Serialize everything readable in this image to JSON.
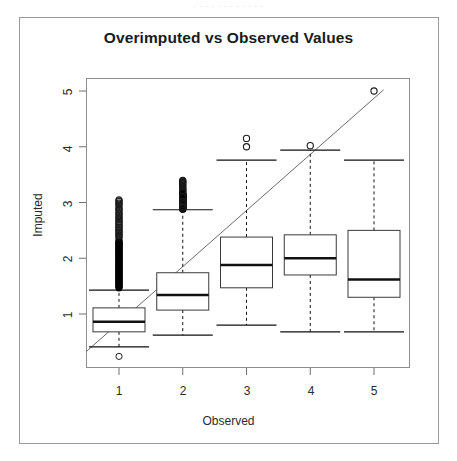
{
  "scan": {
    "top_partial_text": "· ·  ·   ·    ·  ·   ·    ·   ·  ·    ·  ·"
  },
  "figure": {
    "title": "Overimputed vs Observed Values",
    "xlabel": "Observed",
    "ylabel": "Imputed",
    "background": "#ffffff",
    "frame_color": "#9a9a9a",
    "line_color": "#000000"
  },
  "chart_data": {
    "type": "box",
    "title": "Overimputed vs Observed Values",
    "xlabel": "Observed",
    "ylabel": "Imputed",
    "categories": [
      "1",
      "2",
      "3",
      "4",
      "5"
    ],
    "xtick_labels": [
      "1",
      "2",
      "3",
      "4",
      "5"
    ],
    "ytick_labels": [
      "1",
      "2",
      "3",
      "4",
      "5"
    ],
    "ytick_values": [
      1,
      2,
      3,
      4,
      5
    ],
    "xlim": [
      0.45,
      5.55
    ],
    "ylim": [
      0.28,
      5.3
    ],
    "grid": false,
    "legend": "none",
    "reference_line": {
      "type": "identity",
      "description": "y = x diagonal reference line",
      "x0": 0.48,
      "y0": 0.32,
      "x1": 5.15,
      "y1": 5.02
    },
    "boxes": [
      {
        "category": "1",
        "x": 1,
        "whisker_low": 0.41,
        "q1": 0.68,
        "median": 0.86,
        "q3": 1.11,
        "whisker_high": 1.43,
        "outliers_low": [
          0.24
        ],
        "outliers_high_range": [
          1.47,
          3.05
        ],
        "outliers_high_density": "very dense continuous stack from 1.47 to 2.45, scattered circles 2.45 to 3.05",
        "outliers_high_marked": [
          3.03,
          2.97,
          2.88,
          2.8,
          2.72,
          2.66,
          2.6,
          2.55,
          2.5,
          2.45,
          2.4
        ]
      },
      {
        "category": "2",
        "x": 2,
        "whisker_low": 0.62,
        "q1": 1.07,
        "median": 1.34,
        "q3": 1.74,
        "whisker_high": 2.87,
        "outliers_low": [],
        "outliers_high_range": [
          2.88,
          3.4
        ],
        "outliers_high_marked": [
          3.38,
          3.22,
          3.1,
          3.02,
          2.97,
          2.93,
          2.9
        ]
      },
      {
        "category": "3",
        "x": 3,
        "whisker_low": 0.8,
        "q1": 1.47,
        "median": 1.88,
        "q3": 2.38,
        "whisker_high": 3.76,
        "outliers_low": [],
        "outliers_high_marked": [
          4.15,
          4.0
        ]
      },
      {
        "category": "4",
        "x": 4,
        "whisker_low": 0.68,
        "q1": 1.7,
        "median": 2.0,
        "q3": 2.42,
        "whisker_high": 3.94,
        "outliers_low": [],
        "outliers_high_marked": [
          4.02
        ]
      },
      {
        "category": "5",
        "x": 5,
        "whisker_low": 0.68,
        "q1": 1.3,
        "median": 1.62,
        "q3": 2.5,
        "whisker_high": 3.76,
        "outliers_low": [],
        "outliers_high_marked": [
          5.0
        ]
      }
    ]
  }
}
